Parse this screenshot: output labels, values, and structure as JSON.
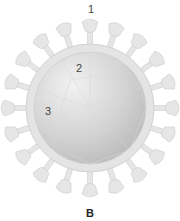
{
  "diagram": {
    "labels": [
      {
        "id": "1",
        "text": "1",
        "points_to": "spike protein"
      },
      {
        "id": "2",
        "text": "2",
        "points_to": "envelope"
      },
      {
        "id": "3",
        "text": "3",
        "points_to": "core"
      }
    ],
    "caption": "B",
    "colors": {
      "spike": "#e6e6e6",
      "spike_stroke": "#c8c8c8",
      "envelope": "#e2e2e2",
      "core_light": "#ececec",
      "core_dark": "#bdbdbd",
      "label": "#444444",
      "caption": "#222222"
    }
  }
}
